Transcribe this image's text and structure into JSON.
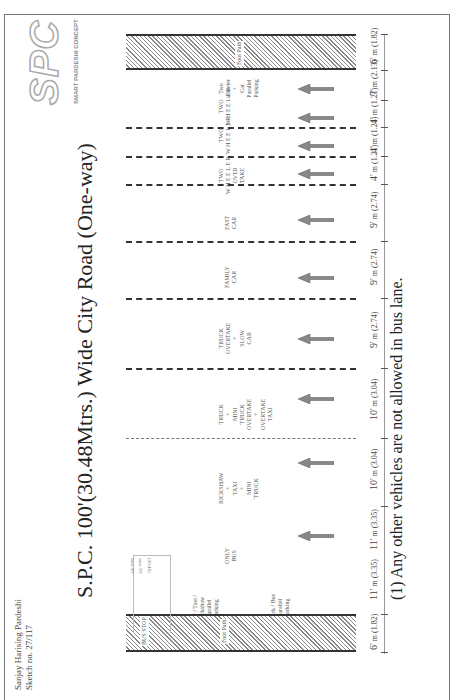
{
  "title": "S.P.C. 100'(30.48Mtrs.) Wide City Road (One-way)",
  "note": "(1) Any other vehicles are not allowed in bus lane.",
  "author": {
    "name": "Sanjay Harising Pardeshi",
    "sketch": "Sketch no. 27/117"
  },
  "logo": {
    "text": "SPC",
    "subtitle": "SMART PARDESHI CONCEPT"
  },
  "direction": "one-way, traffic flows toward top (arrows point up in upright view)",
  "footpath_top": {
    "label": "Foot Path",
    "width_ft": "6'",
    "width_m": "(1.82)"
  },
  "footpath_bottom": {
    "label": "Foot Path",
    "bus_stop": "BUS STOP",
    "width_ft": "6'",
    "width_m": "(1.82)"
  },
  "lanes": [
    {
      "label": "Two wheeler + Car Parallel Parking",
      "width_ft": "7'",
      "width_m": "(2.13)"
    },
    {
      "label": "TWO WHEELER",
      "width_ft": "4'",
      "width_m": "(1.21)"
    },
    {
      "label": "TWO WHEELER",
      "width_ft": "4'",
      "width_m": "(1.21)"
    },
    {
      "label": "TWO WHEELER OVERTAKE",
      "width_ft": "4'",
      "width_m": "(1.21)"
    },
    {
      "label": "FAST CAR",
      "width_ft": "9'",
      "width_m": "(2.74)"
    },
    {
      "label": "FAMILY CAR",
      "width_ft": "9'",
      "width_m": "(2.74)"
    },
    {
      "label": "TRUCK OVERTAKE + SLOW CAR",
      "width_ft": "9'",
      "width_m": "(2.74)"
    },
    {
      "label": "TRUCK + MINI TRUCK OVERTAKE + OVERTAKE TAXI",
      "width_ft": "10'",
      "width_m": "(3.04)"
    },
    {
      "label": "RICKSHAW + TAXI + MINI TRUCK",
      "width_ft": "10'",
      "width_m": "(3.04)"
    },
    {
      "label": "ONLY BUS",
      "width_ft": "11'",
      "width_m": "(3.35)"
    },
    {
      "label": "Car / Taxi / Rickshaw Parallel Parking | Truck / Bus Parallel Parking",
      "width_ft": "11'",
      "width_m": "(3.35)"
    }
  ],
  "unit_m": "m",
  "bay_notes": [
    "max.30'",
    "max.70'",
    "(30.48)"
  ]
}
